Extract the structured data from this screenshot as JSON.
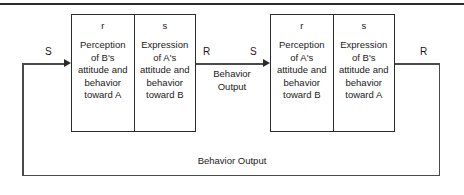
{
  "figure": {
    "colors": {
      "line": "#4a4a4a",
      "box_border": "#2b2b2b",
      "text": "#1a1a1a",
      "background": "#ffffff"
    }
  },
  "units": [
    {
      "id": "unit-left",
      "cells": [
        {
          "tag": "r",
          "body": "Perception of B's attitude and behavior toward A"
        },
        {
          "tag": "s",
          "body": "Expression of A's attitude and behavior toward B"
        }
      ]
    },
    {
      "id": "unit-right",
      "cells": [
        {
          "tag": "r",
          "body": "Perception of A's attitude and behavior toward B"
        },
        {
          "tag": "s",
          "body": "Expression of B's attitude and behavior toward A"
        }
      ]
    }
  ],
  "labels": {
    "s_left": "S",
    "r_middle": "R",
    "s_middle": "S",
    "r_right": "R",
    "behavior_output_middle": "Behavior Output",
    "behavior_output_bottom": "Behavior Output"
  }
}
